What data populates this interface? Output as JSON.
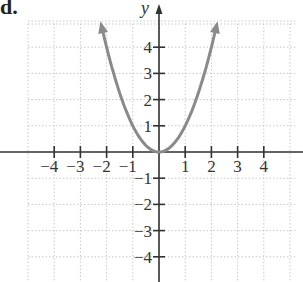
{
  "problem_label": "d.",
  "chart_data": {
    "type": "line",
    "title": "",
    "function": "y = x^2",
    "xlabel": "",
    "ylabel": "y",
    "xlim": [
      -5,
      5
    ],
    "ylim": [
      -5,
      5
    ],
    "grid": true,
    "x_ticks": [
      "−4",
      "−3",
      "−2",
      "−1",
      "1",
      "2",
      "3",
      "4"
    ],
    "y_ticks": [
      "4",
      "3",
      "2",
      "1",
      "−1",
      "−2",
      "−3",
      "−4"
    ],
    "series": [
      {
        "name": "parabola",
        "color": "#8a8a8a",
        "x": [
          -2.2,
          -2,
          -1.5,
          -1,
          -0.5,
          0,
          0.5,
          1,
          1.5,
          2,
          2.2
        ],
        "y": [
          4.84,
          4,
          2.25,
          1,
          0.25,
          0,
          0.25,
          1,
          2.25,
          4,
          4.84
        ],
        "arrows": "both-ends"
      }
    ]
  }
}
